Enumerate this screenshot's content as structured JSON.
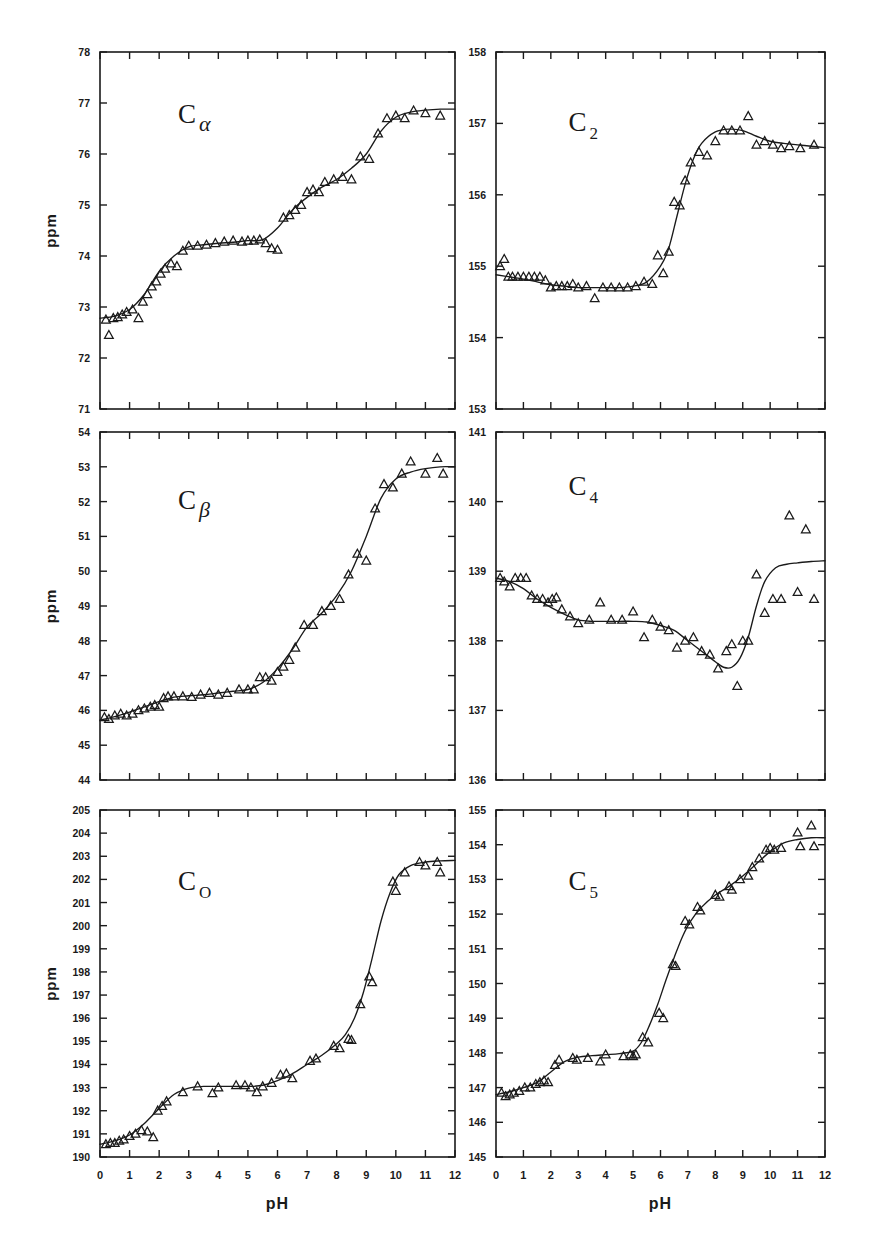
{
  "figure": {
    "background": "#ffffff",
    "ink": "#1a1a1a",
    "x_axis_label": "pH",
    "y_axis_label": "ppm",
    "marker": "open-triangle",
    "curve": "fitted-titration-curve"
  },
  "chart_data": [
    {
      "id": "c-alpha",
      "type": "scatter",
      "title": "C",
      "subscript": "α",
      "panel": "top-left",
      "xlabel": "pH",
      "ylabel": "ppm",
      "xlim": [
        0,
        12
      ],
      "ylim": [
        71,
        78
      ],
      "xticks": [
        0,
        1,
        2,
        3,
        4,
        5,
        6,
        7,
        8,
        9,
        10,
        11,
        12
      ],
      "yticks": [
        71,
        72,
        73,
        74,
        75,
        76,
        77,
        78
      ],
      "ytick_labels": [
        "71",
        "72",
        "73",
        "74",
        "75",
        "76",
        "77",
        "78"
      ],
      "xtick_labels": [
        "0",
        "1",
        "2",
        "3",
        "4",
        "5",
        "6",
        "7",
        "8",
        "9",
        "10",
        "11",
        "12"
      ],
      "grid": false,
      "legend": "none",
      "x": [
        0.2,
        0.3,
        0.45,
        0.6,
        0.75,
        0.9,
        1.1,
        1.3,
        1.45,
        1.6,
        1.75,
        1.9,
        2.05,
        2.2,
        2.4,
        2.6,
        2.8,
        3.0,
        3.3,
        3.6,
        3.9,
        4.2,
        4.5,
        4.8,
        5.0,
        5.2,
        5.4,
        5.6,
        5.8,
        6.0,
        6.2,
        6.4,
        6.6,
        6.8,
        7.0,
        7.2,
        7.4,
        7.6,
        7.9,
        8.2,
        8.5,
        8.8,
        9.1,
        9.4,
        9.7,
        10.0,
        10.3,
        10.6,
        11.0,
        11.5
      ],
      "y": [
        72.75,
        72.45,
        72.78,
        72.8,
        72.85,
        72.9,
        72.95,
        72.78,
        73.1,
        73.25,
        73.4,
        73.5,
        73.65,
        73.75,
        73.85,
        73.8,
        74.1,
        74.2,
        74.2,
        74.22,
        74.25,
        74.28,
        74.3,
        74.28,
        74.3,
        74.3,
        74.32,
        74.25,
        74.15,
        74.12,
        74.75,
        74.8,
        74.9,
        75.0,
        75.25,
        75.3,
        75.25,
        75.45,
        75.5,
        75.55,
        75.5,
        75.95,
        75.9,
        76.4,
        76.7,
        76.75,
        76.7,
        76.85,
        76.8,
        76.75
      ],
      "fit_curve": {
        "x": [
          0,
          0.5,
          1,
          1.5,
          2,
          2.5,
          3,
          3.5,
          4,
          4.5,
          5,
          5.5,
          6,
          6.5,
          7,
          7.5,
          8,
          8.5,
          9,
          9.5,
          10,
          10.5,
          11,
          11.5,
          12
        ],
        "y": [
          72.78,
          72.82,
          72.95,
          73.25,
          73.7,
          74.0,
          74.18,
          74.22,
          74.25,
          74.27,
          74.3,
          74.32,
          74.55,
          74.9,
          75.15,
          75.35,
          75.5,
          75.72,
          76.0,
          76.45,
          76.72,
          76.82,
          76.86,
          76.88,
          76.88
        ]
      }
    },
    {
      "id": "c-2",
      "type": "scatter",
      "title": "C",
      "subscript": "2",
      "panel": "top-right",
      "xlabel": "pH",
      "ylabel": "ppm",
      "xlim": [
        0,
        12
      ],
      "ylim": [
        153,
        158
      ],
      "xticks": [
        0,
        1,
        2,
        3,
        4,
        5,
        6,
        7,
        8,
        9,
        10,
        11,
        12
      ],
      "yticks": [
        153,
        154,
        155,
        156,
        157,
        158
      ],
      "ytick_labels": [
        "153",
        "154",
        "155",
        "156",
        "157",
        "158"
      ],
      "xtick_labels": [
        "0",
        "1",
        "2",
        "3",
        "4",
        "5",
        "6",
        "7",
        "8",
        "9",
        "10",
        "11",
        "12"
      ],
      "grid": false,
      "legend": "none",
      "x": [
        0.15,
        0.3,
        0.45,
        0.6,
        0.8,
        1.0,
        1.2,
        1.4,
        1.6,
        1.8,
        2.0,
        2.2,
        2.4,
        2.6,
        2.8,
        3.0,
        3.3,
        3.6,
        3.9,
        4.2,
        4.5,
        4.8,
        5.1,
        5.4,
        5.7,
        5.9,
        6.1,
        6.3,
        6.5,
        6.7,
        6.9,
        7.1,
        7.4,
        7.7,
        8.0,
        8.3,
        8.6,
        8.9,
        9.2,
        9.5,
        9.8,
        10.1,
        10.4,
        10.7,
        11.1,
        11.6
      ],
      "y": [
        155.0,
        155.1,
        154.85,
        154.85,
        154.85,
        154.85,
        154.85,
        154.85,
        154.85,
        154.8,
        154.7,
        154.72,
        154.72,
        154.72,
        154.75,
        154.7,
        154.72,
        154.55,
        154.7,
        154.7,
        154.7,
        154.7,
        154.72,
        154.78,
        154.75,
        155.15,
        154.9,
        155.2,
        155.9,
        155.85,
        156.2,
        156.45,
        156.6,
        156.55,
        156.75,
        156.9,
        156.9,
        156.9,
        157.1,
        156.7,
        156.75,
        156.7,
        156.65,
        156.68,
        156.65,
        156.7
      ],
      "fit_curve": {
        "x": [
          0,
          0.5,
          1,
          1.5,
          2,
          2.5,
          3,
          3.5,
          4,
          4.5,
          5,
          5.5,
          6,
          6.3,
          6.6,
          6.9,
          7.2,
          7.5,
          8,
          8.5,
          9,
          9.5,
          10,
          10.5,
          11,
          11.5,
          12
        ],
        "y": [
          154.88,
          154.85,
          154.82,
          154.78,
          154.74,
          154.72,
          154.7,
          154.7,
          154.7,
          154.7,
          154.72,
          154.78,
          155.0,
          155.25,
          155.7,
          156.15,
          156.5,
          156.72,
          156.88,
          156.92,
          156.9,
          156.82,
          156.75,
          156.72,
          156.7,
          156.68,
          156.66
        ]
      }
    },
    {
      "id": "c-beta",
      "type": "scatter",
      "title": "C",
      "subscript": "β",
      "panel": "middle-left",
      "xlabel": "pH",
      "ylabel": "ppm",
      "xlim": [
        0,
        12
      ],
      "ylim": [
        44,
        54
      ],
      "xticks": [
        0,
        1,
        2,
        3,
        4,
        5,
        6,
        7,
        8,
        9,
        10,
        11,
        12
      ],
      "yticks": [
        44,
        45,
        46,
        47,
        48,
        49,
        50,
        51,
        52,
        53,
        54
      ],
      "ytick_labels": [
        "44",
        "45",
        "46",
        "47",
        "48",
        "49",
        "50",
        "51",
        "52",
        "53",
        "54"
      ],
      "xtick_labels": [
        "0",
        "1",
        "2",
        "3",
        "4",
        "5",
        "6",
        "7",
        "8",
        "9",
        "10",
        "11",
        "12"
      ],
      "grid": false,
      "legend": "none",
      "x": [
        0.15,
        0.3,
        0.5,
        0.7,
        0.9,
        1.1,
        1.3,
        1.5,
        1.7,
        1.85,
        2.0,
        2.15,
        2.3,
        2.5,
        2.8,
        3.1,
        3.4,
        3.7,
        4.0,
        4.3,
        4.7,
        5.0,
        5.2,
        5.4,
        5.6,
        5.8,
        6.0,
        6.2,
        6.4,
        6.6,
        6.9,
        7.2,
        7.5,
        7.8,
        8.1,
        8.4,
        8.7,
        9.0,
        9.3,
        9.6,
        9.9,
        10.2,
        10.5,
        11.0,
        11.4,
        11.6
      ],
      "y": [
        45.8,
        45.75,
        45.85,
        45.9,
        45.85,
        45.9,
        46.0,
        46.05,
        46.1,
        46.15,
        46.1,
        46.35,
        46.4,
        46.4,
        46.4,
        46.38,
        46.45,
        46.5,
        46.45,
        46.5,
        46.6,
        46.6,
        46.6,
        46.95,
        46.95,
        46.85,
        47.1,
        47.25,
        47.45,
        47.8,
        48.45,
        48.45,
        48.85,
        49.0,
        49.2,
        49.9,
        50.5,
        50.3,
        51.8,
        52.5,
        52.4,
        52.8,
        53.15,
        52.8,
        53.25,
        52.8
      ],
      "fit_curve": {
        "x": [
          0,
          0.5,
          1,
          1.5,
          2,
          2.5,
          3,
          3.5,
          4,
          4.5,
          5,
          5.5,
          6,
          6.5,
          7,
          7.5,
          8,
          8.5,
          9,
          9.5,
          10,
          10.5,
          11,
          11.5,
          12
        ],
        "y": [
          45.72,
          45.82,
          45.95,
          46.1,
          46.25,
          46.38,
          46.42,
          46.45,
          46.5,
          46.55,
          46.6,
          46.8,
          47.2,
          47.75,
          48.4,
          48.8,
          49.3,
          50.0,
          51.0,
          52.1,
          52.65,
          52.85,
          52.95,
          53.0,
          53.0
        ]
      }
    },
    {
      "id": "c-4",
      "type": "scatter",
      "title": "C",
      "subscript": "4",
      "panel": "middle-right",
      "xlabel": "pH",
      "ylabel": "ppm",
      "xlim": [
        0,
        12
      ],
      "ylim": [
        136,
        141
      ],
      "xticks": [
        0,
        1,
        2,
        3,
        4,
        5,
        6,
        7,
        8,
        9,
        10,
        11,
        12
      ],
      "yticks": [
        136,
        137,
        138,
        139,
        140,
        141
      ],
      "ytick_labels": [
        "136",
        "137",
        "138",
        "139",
        "140",
        "141"
      ],
      "xtick_labels": [
        "0",
        "1",
        "2",
        "3",
        "4",
        "5",
        "6",
        "7",
        "8",
        "9",
        "10",
        "11",
        "12"
      ],
      "grid": false,
      "legend": "none",
      "x": [
        0.15,
        0.3,
        0.5,
        0.7,
        0.9,
        1.1,
        1.3,
        1.5,
        1.7,
        1.9,
        2.05,
        2.2,
        2.4,
        2.7,
        3.0,
        3.4,
        3.8,
        4.2,
        4.6,
        5.0,
        5.4,
        5.7,
        6.0,
        6.3,
        6.6,
        6.9,
        7.2,
        7.5,
        7.8,
        8.1,
        8.4,
        8.6,
        8.8,
        9.0,
        9.2,
        9.5,
        9.8,
        10.1,
        10.4,
        10.7,
        11.0,
        11.3,
        11.6
      ],
      "y": [
        138.9,
        138.85,
        138.78,
        138.9,
        138.9,
        138.9,
        138.65,
        138.6,
        138.6,
        138.55,
        138.6,
        138.62,
        138.45,
        138.35,
        138.25,
        138.3,
        138.55,
        138.3,
        138.3,
        138.42,
        138.05,
        138.3,
        138.2,
        138.15,
        137.9,
        138.0,
        138.05,
        137.85,
        137.8,
        137.6,
        137.85,
        137.95,
        137.35,
        138.0,
        138.0,
        138.95,
        138.4,
        138.6,
        138.6,
        139.8,
        138.7,
        139.6,
        138.6
      ],
      "fit_curve": {
        "x": [
          0,
          0.5,
          1,
          1.5,
          2,
          2.5,
          3,
          3.5,
          4,
          4.5,
          5,
          5.5,
          6,
          6.5,
          7,
          7.5,
          8,
          8.3,
          8.6,
          8.9,
          9.2,
          9.5,
          9.8,
          10.2,
          10.6,
          11,
          11.5,
          12
        ],
        "y": [
          138.9,
          138.85,
          138.75,
          138.6,
          138.48,
          138.38,
          138.3,
          138.28,
          138.28,
          138.28,
          138.28,
          138.27,
          138.22,
          138.15,
          138.0,
          137.85,
          137.7,
          137.62,
          137.62,
          137.75,
          138.05,
          138.5,
          138.85,
          139.05,
          139.1,
          139.12,
          139.14,
          139.15
        ]
      }
    },
    {
      "id": "c-o",
      "type": "scatter",
      "title": "C",
      "subscript": "O",
      "panel": "bottom-left",
      "xlabel": "pH",
      "ylabel": "ppm",
      "xlim": [
        0,
        12
      ],
      "ylim": [
        190,
        205
      ],
      "xticks": [
        0,
        1,
        2,
        3,
        4,
        5,
        6,
        7,
        8,
        9,
        10,
        11,
        12
      ],
      "yticks": [
        190,
        191,
        192,
        193,
        194,
        195,
        196,
        197,
        198,
        199,
        200,
        201,
        202,
        203,
        204,
        205
      ],
      "ytick_labels": [
        "190",
        "191",
        "192",
        "193",
        "194",
        "195",
        "196",
        "197",
        "198",
        "199",
        "200",
        "201",
        "202",
        "203",
        "204",
        "205"
      ],
      "xtick_labels": [
        "0",
        "1",
        "2",
        "3",
        "4",
        "5",
        "6",
        "7",
        "8",
        "9",
        "10",
        "11",
        "12"
      ],
      "grid": false,
      "legend": "none",
      "x": [
        0.2,
        0.35,
        0.5,
        0.65,
        0.8,
        1.0,
        1.2,
        1.4,
        1.6,
        1.8,
        1.95,
        2.1,
        2.25,
        2.8,
        3.3,
        3.8,
        4.0,
        4.6,
        4.9,
        5.1,
        5.3,
        5.5,
        5.8,
        6.1,
        6.3,
        6.5,
        7.1,
        7.3,
        7.9,
        8.1,
        8.4,
        8.5,
        8.8,
        9.1,
        9.2,
        9.9,
        10.0,
        10.3,
        10.8,
        11.0,
        11.4,
        11.5
      ],
      "y": [
        190.55,
        190.6,
        190.6,
        190.7,
        190.75,
        190.9,
        191.0,
        191.15,
        191.1,
        190.85,
        192.0,
        192.2,
        192.4,
        192.8,
        193.05,
        192.75,
        193.0,
        193.1,
        193.1,
        193.0,
        192.8,
        193.05,
        193.2,
        193.55,
        193.6,
        193.4,
        194.15,
        194.25,
        194.8,
        194.7,
        195.1,
        195.05,
        196.6,
        197.8,
        197.55,
        201.9,
        201.5,
        202.3,
        202.75,
        202.6,
        202.75,
        202.3
      ],
      "fit_curve": {
        "x": [
          0,
          0.5,
          1,
          1.5,
          2,
          2.5,
          3,
          3.5,
          4,
          4.5,
          5,
          5.5,
          6,
          6.5,
          7,
          7.5,
          8,
          8.3,
          8.6,
          8.9,
          9.2,
          9.5,
          9.8,
          10.1,
          10.5,
          11,
          11.5,
          12
        ],
        "y": [
          190.55,
          190.7,
          190.95,
          191.45,
          192.1,
          192.7,
          192.98,
          193.05,
          193.05,
          193.05,
          193.05,
          193.1,
          193.3,
          193.6,
          194.0,
          194.4,
          194.9,
          195.3,
          196.0,
          197.1,
          198.6,
          200.2,
          201.4,
          202.2,
          202.6,
          202.75,
          202.8,
          202.82
        ]
      }
    },
    {
      "id": "c-5",
      "type": "scatter",
      "title": "C",
      "subscript": "5",
      "panel": "bottom-right",
      "xlabel": "pH",
      "ylabel": "ppm",
      "xlim": [
        0,
        12
      ],
      "ylim": [
        145,
        155
      ],
      "xticks": [
        0,
        1,
        2,
        3,
        4,
        5,
        6,
        7,
        8,
        9,
        10,
        11,
        12
      ],
      "yticks": [
        145,
        146,
        147,
        148,
        149,
        150,
        151,
        152,
        153,
        154,
        155
      ],
      "ytick_labels": [
        "145",
        "146",
        "147",
        "148",
        "149",
        "150",
        "151",
        "152",
        "153",
        "154",
        "155"
      ],
      "xtick_labels": [
        "0",
        "1",
        "2",
        "3",
        "4",
        "5",
        "6",
        "7",
        "8",
        "9",
        "10",
        "11",
        "12"
      ],
      "grid": false,
      "legend": "none",
      "x": [
        0.2,
        0.35,
        0.5,
        0.65,
        0.85,
        1.05,
        1.25,
        1.45,
        1.6,
        1.75,
        1.9,
        2.15,
        2.3,
        2.8,
        2.95,
        3.35,
        3.8,
        4.0,
        4.65,
        4.9,
        5.0,
        5.1,
        5.35,
        5.55,
        5.95,
        6.1,
        6.45,
        6.55,
        6.9,
        7.05,
        7.35,
        7.45,
        8.0,
        8.15,
        8.5,
        8.6,
        8.9,
        9.2,
        9.35,
        9.6,
        9.85,
        10.0,
        10.15,
        10.4,
        11.0,
        11.1,
        11.5,
        11.6
      ],
      "y": [
        146.85,
        146.75,
        146.8,
        146.85,
        146.9,
        147.0,
        147.0,
        147.1,
        147.15,
        147.2,
        147.15,
        147.65,
        147.8,
        147.85,
        147.8,
        147.85,
        147.75,
        147.95,
        147.9,
        147.95,
        147.9,
        147.95,
        148.45,
        148.3,
        149.15,
        149.0,
        150.55,
        150.5,
        151.8,
        151.7,
        152.2,
        152.1,
        152.55,
        152.5,
        152.8,
        152.7,
        153.0,
        153.1,
        153.35,
        153.6,
        153.85,
        153.9,
        153.85,
        153.9,
        154.35,
        153.95,
        154.55,
        153.95
      ],
      "fit_curve": {
        "x": [
          0,
          0.5,
          1,
          1.5,
          2,
          2.5,
          3,
          3.5,
          4,
          4.5,
          5,
          5.3,
          5.6,
          5.9,
          6.2,
          6.5,
          6.8,
          7.1,
          7.5,
          8,
          8.5,
          9,
          9.5,
          10,
          10.5,
          11,
          11.5,
          12
        ],
        "y": [
          146.8,
          146.88,
          147.0,
          147.15,
          147.45,
          147.75,
          147.88,
          147.92,
          147.95,
          147.98,
          148.05,
          148.3,
          148.8,
          149.4,
          150.1,
          150.75,
          151.35,
          151.8,
          152.2,
          152.55,
          152.8,
          153.1,
          153.45,
          153.8,
          154.05,
          154.15,
          154.2,
          154.2
        ]
      }
    }
  ]
}
